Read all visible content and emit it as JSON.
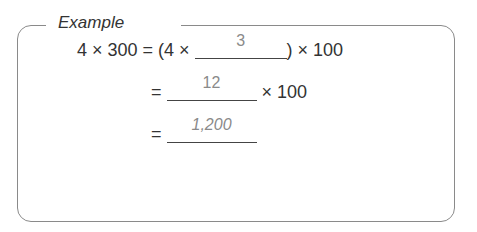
{
  "title": "Example",
  "lines": [
    {
      "lhs": "4 × 300 = (4 × ",
      "answer": "3",
      "rhs": ") × 100"
    },
    {
      "lhs": "= ",
      "answer": "12",
      "rhs": " × 100"
    },
    {
      "lhs": "= ",
      "answer": "1,200",
      "rhs": ""
    }
  ],
  "colors": {
    "border": "#8a8a8a",
    "answer_text": "#8a8a8a",
    "text": "#333333"
  }
}
